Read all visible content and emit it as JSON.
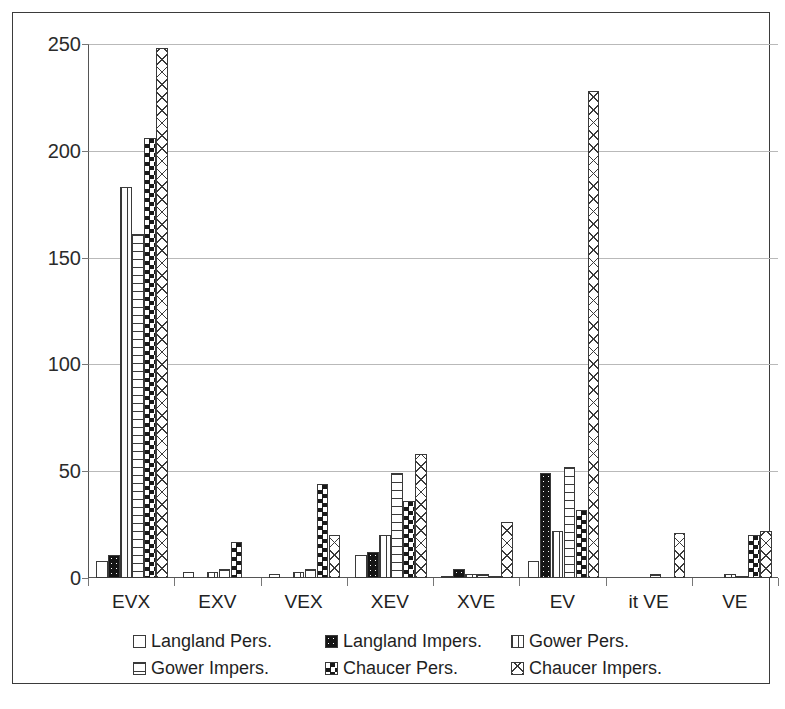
{
  "chart_data": {
    "type": "bar",
    "title": "",
    "subtitle": "",
    "xlabel": "",
    "ylabel": "",
    "ylim": [
      0,
      250
    ],
    "yticks": [
      0,
      50,
      100,
      150,
      200,
      250
    ],
    "grid": true,
    "legend_position": "bottom",
    "categories": [
      "EVX",
      "EXV",
      "VEX",
      "XEV",
      "XVE",
      "EV",
      "it VE",
      "VE"
    ],
    "series": [
      {
        "name": "Langland Pers.",
        "pattern": "light-dots",
        "values": [
          8,
          3,
          2,
          11,
          1,
          8,
          0,
          0
        ]
      },
      {
        "name": "Langland Impers.",
        "pattern": "solid-black-dots",
        "values": [
          11,
          0,
          0,
          12,
          4,
          49,
          0,
          0
        ]
      },
      {
        "name": "Gower Pers.",
        "pattern": "vertical-lines",
        "values": [
          183,
          3,
          3,
          20,
          2,
          22,
          0,
          2
        ]
      },
      {
        "name": "Gower Impers.",
        "pattern": "horizontal-lines",
        "values": [
          161,
          4,
          4,
          49,
          2,
          52,
          2,
          1
        ]
      },
      {
        "name": "Chaucer Pers.",
        "pattern": "checkerboard",
        "values": [
          206,
          17,
          44,
          36,
          1,
          32,
          0,
          20
        ]
      },
      {
        "name": "Chaucer Impers.",
        "pattern": "diagonal-crosshatch",
        "values": [
          248,
          0,
          20,
          58,
          26,
          228,
          21,
          22
        ]
      }
    ]
  },
  "legend": {
    "items": [
      {
        "label": "Langland Pers."
      },
      {
        "label": "Langland Impers."
      },
      {
        "label": "Gower Pers."
      },
      {
        "label": "Gower Impers."
      },
      {
        "label": "Chaucer Pers."
      },
      {
        "label": "Chaucer Impers."
      }
    ]
  },
  "caption": {
    "text": ""
  }
}
